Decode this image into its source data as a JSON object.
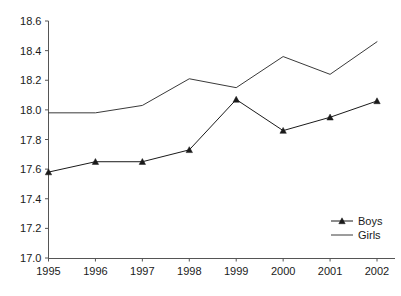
{
  "chart_data": {
    "type": "line",
    "title": "",
    "subtitle": "",
    "xlabel": "",
    "ylabel": "",
    "categories": [
      "1995",
      "1996",
      "1997",
      "1998",
      "1999",
      "2000",
      "2001",
      "2002"
    ],
    "x": [
      1995,
      1996,
      1997,
      1998,
      1999,
      2000,
      2001,
      2002
    ],
    "xlim": [
      1995,
      2002
    ],
    "ylim": [
      17.0,
      18.6
    ],
    "yticks": [
      "17.0",
      "17.2",
      "17.4",
      "17.6",
      "17.8",
      "18.0",
      "18.2",
      "18.4",
      "18.6"
    ],
    "ytick_values": [
      17.0,
      17.2,
      17.4,
      17.6,
      17.8,
      18.0,
      18.2,
      18.4,
      18.6
    ],
    "grid": false,
    "legend_position": "lower-right",
    "series": [
      {
        "name": "Boys",
        "marker": "triangle",
        "color": "#1a1a1a",
        "values": [
          17.58,
          17.65,
          17.65,
          17.73,
          18.07,
          17.86,
          17.95,
          18.06
        ]
      },
      {
        "name": "Girls",
        "marker": "none",
        "color": "#3a3a3a",
        "values": [
          17.98,
          17.98,
          18.03,
          18.21,
          18.15,
          18.36,
          18.24,
          18.46
        ]
      }
    ]
  },
  "axis": {
    "y_labels": [
      "18.6",
      "18.4",
      "18.2",
      "18.0",
      "17.8",
      "17.6",
      "17.4",
      "17.2",
      "17.0"
    ],
    "x_labels": [
      "1995",
      "1996",
      "1997",
      "1998",
      "1999",
      "2000",
      "2001",
      "2002"
    ]
  },
  "legend": {
    "items": [
      {
        "label": "Boys"
      },
      {
        "label": "Girls"
      }
    ]
  }
}
